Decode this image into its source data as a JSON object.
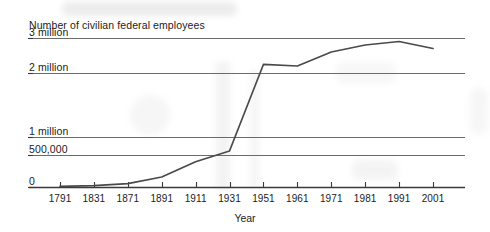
{
  "chart_data": {
    "type": "line",
    "title": "Number of civilian federal employees",
    "xlabel": "Year",
    "ylabel": "",
    "grid": true,
    "legend": null,
    "x_axis_type": "category-nonuniform",
    "y_axis_type": "nonuniform",
    "categories": [
      "1791",
      "1831",
      "1871",
      "1891",
      "1911",
      "1931",
      "1951",
      "1961",
      "1971",
      "1981",
      "1991",
      "2001"
    ],
    "y_ticks": [
      "0",
      "500,000",
      "1 million",
      "2 million",
      "3 million"
    ],
    "y_tick_values": [
      0,
      500000,
      1000000,
      2000000,
      3000000
    ],
    "ylim": [
      0,
      3000000
    ],
    "values": [
      10000,
      20000,
      51000,
      157000,
      396000,
      610000,
      2250000,
      2200000,
      2600000,
      2800000,
      2900000,
      2700000
    ],
    "series": [
      {
        "name": "Civilian federal employees",
        "color": "#4a4a4a",
        "values": [
          10000,
          20000,
          51000,
          157000,
          396000,
          610000,
          2250000,
          2200000,
          2600000,
          2800000,
          2900000,
          2700000
        ]
      }
    ],
    "points": [
      {
        "x": "1791",
        "y": 10000
      },
      {
        "x": "1831",
        "y": 20000
      },
      {
        "x": "1871",
        "y": 51000
      },
      {
        "x": "1891",
        "y": 157000
      },
      {
        "x": "1911",
        "y": 396000
      },
      {
        "x": "1931",
        "y": 610000
      },
      {
        "x": "1951",
        "y": 2250000
      },
      {
        "x": "1961",
        "y": 2200000
      },
      {
        "x": "1971",
        "y": 2600000
      },
      {
        "x": "1981",
        "y": 2800000
      },
      {
        "x": "1991",
        "y": 2900000
      },
      {
        "x": "2001",
        "y": 2700000
      }
    ],
    "colors": {
      "line": "#4a4a4a",
      "grid": "#5a5a5a",
      "axis": "#3a3a3a",
      "text": "#1b1b1b",
      "background": "#ffffff"
    }
  }
}
